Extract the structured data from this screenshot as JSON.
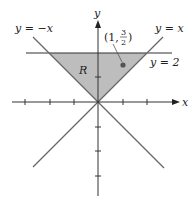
{
  "diagram": {
    "axes": {
      "x_label": "x",
      "y_label": "y"
    },
    "lines": {
      "y_eq_neg_x": "y = −x",
      "y_eq_x": "y = x",
      "y_eq_2": "y = 2"
    },
    "region_label": "R",
    "point": {
      "open": "(1, ",
      "num": "3",
      "den": "2",
      "close": ")"
    },
    "colors": {
      "region_fill": "#bdbdbd",
      "line": "#555555",
      "axis": "#333333"
    }
  }
}
